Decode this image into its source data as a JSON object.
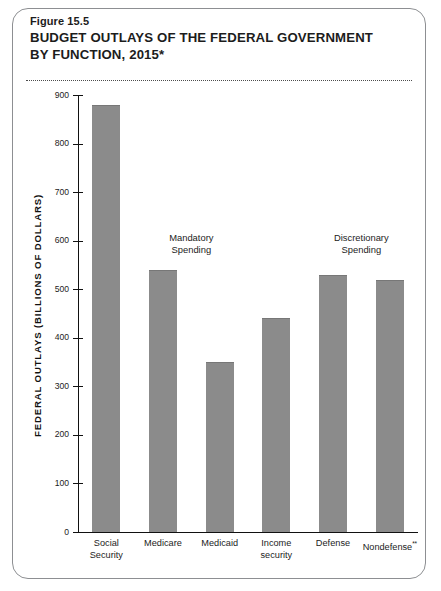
{
  "figure": {
    "number": "Figure 15.5",
    "title_line1": "BUDGET OUTLAYS OF THE FEDERAL GOVERNMENT",
    "title_line2": "BY FUNCTION, 2015*"
  },
  "chart_data": {
    "type": "bar",
    "title": "BUDGET OUTLAYS OF THE FEDERAL GOVERNMENT BY FUNCTION, 2015*",
    "categories": [
      "Social\nSecurity",
      "Medicare",
      "Medicaid",
      "Income\nsecurity",
      "Defense",
      "Nondefense"
    ],
    "category_superscripts": [
      "",
      "",
      "",
      "",
      "",
      "**"
    ],
    "values": [
      880,
      540,
      350,
      440,
      530,
      520
    ],
    "xlabel": "",
    "ylabel": "FEDERAL OUTLAYS (BILLIONS OF DOLLARS)",
    "ylim": [
      0,
      900
    ],
    "ytick_values": [
      0,
      100,
      200,
      300,
      400,
      500,
      600,
      700,
      800,
      900
    ],
    "ytick_labels": [
      "0",
      "100",
      "200",
      "300",
      "400",
      "500",
      "600",
      "700",
      "800",
      "900"
    ],
    "grid": false,
    "legend": "none",
    "bar_color": "#8b8b8b",
    "axis_color": "#111111",
    "annotations": [
      {
        "text": "Mandatory\nSpending",
        "near_categories": [
          "Medicare",
          "Medicaid"
        ]
      },
      {
        "text": "Discretionary\nSpending",
        "near_categories": [
          "Defense",
          "Nondefense"
        ]
      }
    ]
  }
}
